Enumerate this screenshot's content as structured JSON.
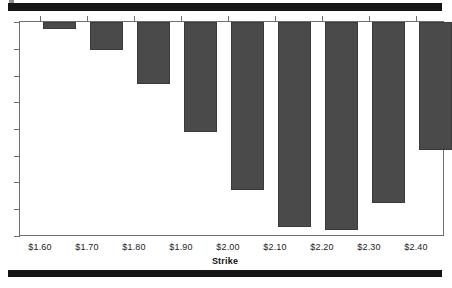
{
  "figure": {
    "top_rule_color": "#141414",
    "bottom_rule_color": "#141414",
    "bar_color": "#4a4a4a",
    "axis_color": "#6f6f6f",
    "background": "#ffffff"
  },
  "chart_data": {
    "type": "bar",
    "title": "",
    "subtitle": "",
    "xlabel": "Strike",
    "ylabel": "",
    "orientation": "vertical-downward",
    "grid": false,
    "legend": null,
    "legend_position": "none",
    "axis_note": "Bars hang downward from the zero line at the top; y-axis has 9 unlabeled tick marks.",
    "categories": [
      "$1.60",
      "$1.70",
      "$1.80",
      "$1.90",
      "$2.00",
      "$2.10",
      "$2.20",
      "$2.30",
      "$2.40"
    ],
    "values": [
      -0.3,
      -1.1,
      -2.3,
      -4.1,
      -6.3,
      -7.7,
      -7.8,
      -6.8,
      -4.8
    ],
    "ylim": [
      -8,
      0
    ],
    "ytick_count": 9,
    "ytick_labels": [],
    "bar_depth_px": [
      7,
      28,
      62,
      110,
      168,
      205,
      208,
      181,
      128
    ]
  },
  "ticks": {
    "y_positions_px": [
      22,
      49,
      76,
      102,
      129,
      156,
      182,
      209,
      236
    ],
    "x_positions_px": [
      40,
      87,
      134,
      181,
      228,
      275,
      322,
      369,
      416
    ]
  },
  "bars_layout": {
    "left_px": [
      24,
      71,
      118,
      165,
      212,
      259,
      306,
      353,
      400
    ],
    "width_px": 33
  }
}
